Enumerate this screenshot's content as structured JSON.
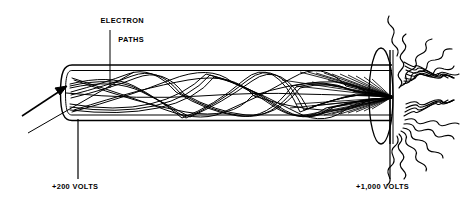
{
  "figure": {
    "background_color": "#ffffff",
    "ink_color": "#000000",
    "width": 474,
    "height": 211
  },
  "labels": {
    "electron_paths": "ELECTRON\nPATHS",
    "electron_paths_line1": "ELECTRON",
    "electron_paths_line2": "PATHS",
    "cathode_voltage": "+200 VOLTS",
    "anode_voltage": "+1,000 VOLTS"
  },
  "parts": {
    "tube_name": "vacuum-tube-body",
    "cathode_end_name": "cathode-rounded-end",
    "anode_plate_name": "anode-target-plate",
    "beam_name": "electron-beam-paths",
    "rays_name": "x-ray-emission-rays",
    "entry_arrow_name": "beam-entry-arrow"
  },
  "geometry": {
    "tube_left_x": 62,
    "tube_right_x": 392,
    "tube_top_y": 68,
    "tube_bottom_y": 119,
    "tube_outer_top_y": 65,
    "tube_outer_bottom_y": 122,
    "focal_point_x": 393,
    "focal_point_y": 97,
    "anode_ellipse_cx": 381,
    "anode_ellipse_cy": 96,
    "anode_ellipse_rx": 12,
    "anode_ellipse_ry": 48,
    "ray_count": 20,
    "ray_inner_radius": 10,
    "ray_outer_radius": 84,
    "electron_path_count": 14
  },
  "leaders": {
    "electron_paths_leader": {
      "x1": 110,
      "y1": 30,
      "x2": 110,
      "y2": 88
    },
    "cathode_leader": {
      "x1": 78,
      "y1": 119,
      "x2": 78,
      "y2": 179
    },
    "anode_leader": {
      "x1": 390,
      "y1": 62,
      "x2": 390,
      "y2": 179
    },
    "entry_arrow": {
      "x1": 22,
      "y1": 116,
      "x2": 68,
      "y2": 86
    },
    "diagonal_guide": {
      "x1": 28,
      "y1": 133,
      "x2": 134,
      "y2": 72
    }
  }
}
